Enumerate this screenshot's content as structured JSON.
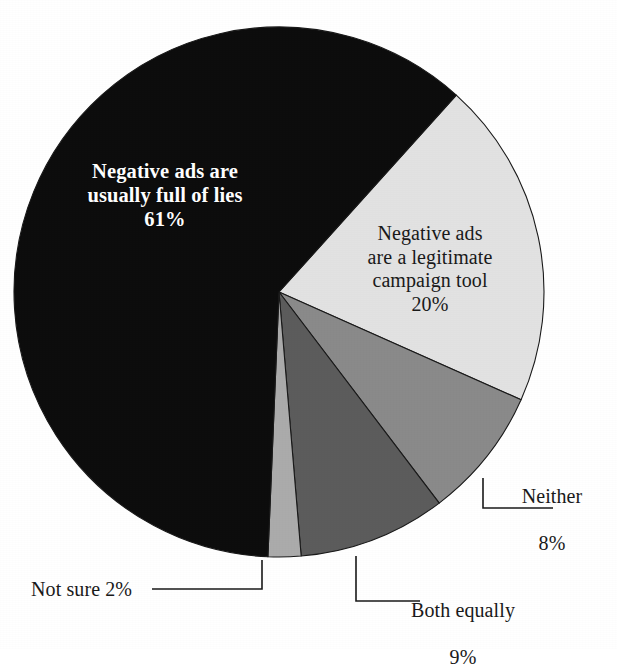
{
  "chart_data": {
    "type": "pie",
    "title": "",
    "subtitle": "",
    "xlabel": "",
    "ylabel": "",
    "legend_position": "none",
    "grid": false,
    "units": "percent",
    "total": 100,
    "start_angle_deg": 42,
    "direction": "clockwise",
    "categories": [
      "Negative ads are a legitimate campaign tool",
      "Neither",
      "Both equally",
      "Not sure",
      "Negative ads are usually full of lies"
    ],
    "values": [
      20,
      8,
      9,
      2,
      61
    ],
    "slices": [
      {
        "id": "legitimate-tool",
        "label_lines": [
          "Negative ads",
          "are a legitimate",
          "campaign tool",
          "20%"
        ],
        "label_text": "Negative ads are a legitimate campaign tool",
        "value": 20,
        "value_text": "20%",
        "color": "#e2e2e2",
        "label_placement": "inside",
        "text_color": "#1a1a1a"
      },
      {
        "id": "neither",
        "label_lines": [
          "Neither",
          "8%"
        ],
        "label_text": "Neither",
        "value": 8,
        "value_text": "8%",
        "color": "#8a8a8a",
        "label_placement": "callout",
        "text_color": "#1a1a1a"
      },
      {
        "id": "both-equally",
        "label_lines": [
          "Both equally",
          "9%"
        ],
        "label_text": "Both equally",
        "value": 9,
        "value_text": "9%",
        "color": "#5c5c5c",
        "label_placement": "callout",
        "text_color": "#1a1a1a"
      },
      {
        "id": "not-sure",
        "label_lines": [
          "Not sure 2%"
        ],
        "label_text": "Not sure",
        "value": 2,
        "value_text": "2%",
        "color": "#ababab",
        "label_placement": "callout",
        "text_color": "#1a1a1a"
      },
      {
        "id": "full-of-lies",
        "label_lines": [
          "Negative ads are",
          "usually full of lies",
          "61%"
        ],
        "label_text": "Negative ads are usually full of lies",
        "value": 61,
        "value_text": "61%",
        "color": "#0d0d0d",
        "label_placement": "inside",
        "text_color": "#ffffff"
      }
    ]
  },
  "labels": {
    "full_of_lies": "Negative ads are\nusually full of lies\n61%",
    "legitimate_tool": "Negative ads\nare a legitimate\ncampaign tool\n20%",
    "neither_line1": "Neither",
    "neither_line2": "8%",
    "both_equally_line1": "Both equally",
    "both_equally_line2": "9%",
    "not_sure": "Not sure 2%"
  },
  "colors": {
    "background": "#ffffff",
    "outline": "#1a1a1a",
    "slice_black": "#0d0d0d",
    "slice_very_light": "#e2e2e2",
    "slice_light": "#ababab",
    "slice_medium": "#8a8a8a",
    "slice_dark": "#5c5c5c",
    "text_dark": "#1a1a1a",
    "text_light": "#ffffff"
  },
  "geometry": {
    "center_x": 279,
    "center_y": 292,
    "radius": 265
  }
}
